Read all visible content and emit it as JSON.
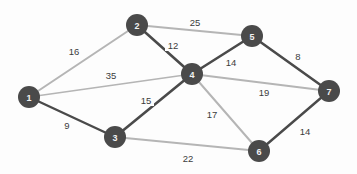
{
  "figure": {
    "kind": "weighted-undirected-graph",
    "background_color": "#fdfdfd",
    "node_fill_color": "#4a4a4a",
    "node_label_color": "#f2f2f2",
    "edge_dark_color": "#4a4a4a",
    "edge_light_color": "#b5b5b5",
    "weight_label_color": "#3c3c3c"
  },
  "graph_data": {
    "type": "graph",
    "title": "",
    "node_radius": 11,
    "nodes": [
      {
        "id": "1",
        "label": "1",
        "x": 29,
        "y": 97
      },
      {
        "id": "2",
        "label": "2",
        "x": 137,
        "y": 25
      },
      {
        "id": "3",
        "label": "3",
        "x": 115,
        "y": 137
      },
      {
        "id": "4",
        "label": "4",
        "x": 192,
        "y": 74
      },
      {
        "id": "5",
        "label": "5",
        "x": 252,
        "y": 36
      },
      {
        "id": "6",
        "label": "6",
        "x": 259,
        "y": 151
      },
      {
        "id": "7",
        "label": "7",
        "x": 329,
        "y": 91
      }
    ],
    "edges": [
      {
        "source": "1",
        "target": "2",
        "weight": 16,
        "label": "16",
        "label_x": 74,
        "label_y": 51,
        "shade": "light",
        "width": 2.0
      },
      {
        "source": "1",
        "target": "4",
        "weight": 35,
        "label": "35",
        "label_x": 111,
        "label_y": 75,
        "shade": "light",
        "width": 1.6
      },
      {
        "source": "1",
        "target": "3",
        "weight": 9,
        "label": "9",
        "label_x": 67,
        "label_y": 125,
        "shade": "dark",
        "width": 2.4
      },
      {
        "source": "2",
        "target": "5",
        "weight": 25,
        "label": "25",
        "label_x": 195,
        "label_y": 22,
        "shade": "light",
        "width": 2.0
      },
      {
        "source": "2",
        "target": "4",
        "weight": 12,
        "label": "12",
        "label_x": 173,
        "label_y": 45,
        "shade": "dark",
        "width": 2.6
      },
      {
        "source": "3",
        "target": "4",
        "weight": 15,
        "label": "15",
        "label_x": 146,
        "label_y": 100,
        "shade": "dark",
        "width": 2.6
      },
      {
        "source": "3",
        "target": "6",
        "weight": 22,
        "label": "22",
        "label_x": 188,
        "label_y": 158,
        "shade": "light",
        "width": 2.0
      },
      {
        "source": "4",
        "target": "5",
        "weight": 14,
        "label": "14",
        "label_x": 231,
        "label_y": 62,
        "shade": "dark",
        "width": 2.6
      },
      {
        "source": "4",
        "target": "7",
        "weight": 19,
        "label": "19",
        "label_x": 264,
        "label_y": 92,
        "shade": "light",
        "width": 1.8
      },
      {
        "source": "4",
        "target": "6",
        "weight": 17,
        "label": "17",
        "label_x": 212,
        "label_y": 114,
        "shade": "light",
        "width": 2.0
      },
      {
        "source": "5",
        "target": "7",
        "weight": 8,
        "label": "8",
        "label_x": 298,
        "label_y": 56,
        "shade": "dark",
        "width": 2.6
      },
      {
        "source": "6",
        "target": "7",
        "weight": 14,
        "label": "14",
        "label_x": 305,
        "label_y": 131,
        "shade": "dark",
        "width": 2.4
      }
    ]
  }
}
